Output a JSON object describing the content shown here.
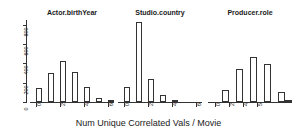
{
  "chart_data": {
    "type": "bar",
    "title": "",
    "xlabel": "Num Unique Correlated Vals / Movie",
    "ylabel": "Frequency",
    "ylim": [
      0,
      850
    ],
    "yticks": [
      0,
      200,
      400,
      600,
      800
    ],
    "ytick_labels": [
      "0",
      "200",
      "400",
      "600",
      "800"
    ],
    "grid": false,
    "legend": null,
    "panels": [
      {
        "title": "Actor.birthYear",
        "xlim": [
          -0.5,
          6.5
        ],
        "xticks": [
          0,
          2,
          4,
          6
        ],
        "xtick_labels": [
          "0",
          "2",
          "4",
          "6"
        ],
        "bin_width": 0.5,
        "bin_starts": [
          0.0,
          0.5,
          1.0,
          1.5,
          2.0,
          2.5,
          3.0,
          3.5,
          4.0,
          4.5,
          5.0,
          5.5,
          6.0
        ],
        "values": [
          150,
          0,
          305,
          0,
          420,
          0,
          315,
          0,
          160,
          0,
          45,
          0,
          8
        ]
      },
      {
        "title": "Studio.country",
        "xlim": [
          -0.5,
          6.5
        ],
        "xticks": [
          0,
          2,
          4,
          6
        ],
        "xtick_labels": [
          "0",
          "2",
          "4",
          "6"
        ],
        "bin_width": 0.5,
        "bin_starts": [
          0.0,
          0.5,
          1.0,
          1.5,
          2.0,
          2.5,
          3.0,
          3.5,
          4.0,
          4.5,
          5.0,
          5.5,
          6.0
        ],
        "values": [
          160,
          0,
          830,
          0,
          235,
          0,
          75,
          0,
          20,
          0,
          0,
          0,
          0
        ]
      },
      {
        "title": "Producer.role",
        "xlim": [
          -0.5,
          5.5
        ],
        "xticks": [
          0,
          1,
          2,
          3,
          4,
          5
        ],
        "xtick_labels": [
          "0",
          "2",
          "4",
          "5"
        ],
        "bin_width": 0.5,
        "bin_starts": [
          0.0,
          0.5,
          1.0,
          1.5,
          2.0,
          2.5,
          3.0,
          3.5,
          4.0,
          4.5,
          5.0
        ],
        "values": [
          0,
          125,
          0,
          340,
          0,
          470,
          0,
          395,
          0,
          100,
          10
        ]
      }
    ]
  },
  "figure": {
    "axis_color": "#333333",
    "bar_fill": "#ffffff",
    "bar_stroke": "#333333",
    "text_color": "#1a1a1a",
    "background": "#ffffff"
  }
}
